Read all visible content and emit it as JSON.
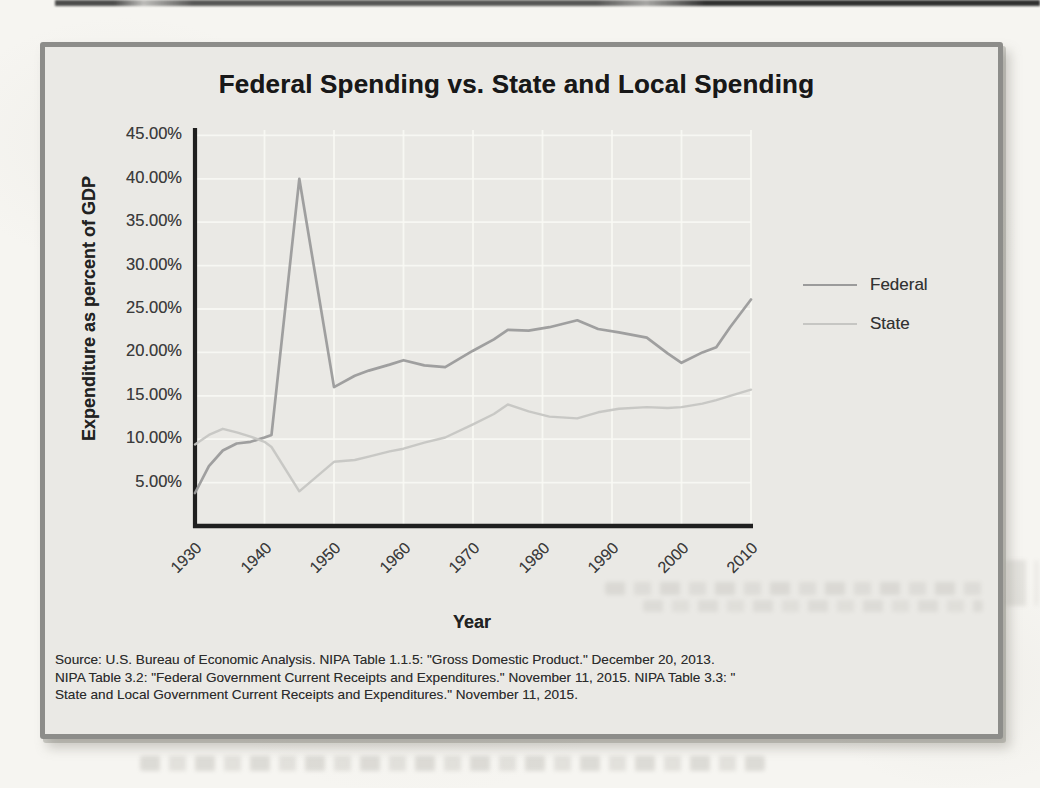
{
  "colors": {
    "page_bg": "#f6f5f1",
    "frame_bg": "#eae9e5",
    "frame_border": "#8d8d8a",
    "grid": "#f8f8f4",
    "axis": "#1f1f1f",
    "federal_line": "#9b9b9b",
    "state_line": "#c6c6c3",
    "text": "#2c2c2c"
  },
  "chart_data": {
    "type": "line",
    "title": "Federal Spending vs. State and Local Spending",
    "xlabel": "Year",
    "ylabel": "Expenditure as percent of GDP",
    "xlim": [
      1930,
      2010
    ],
    "ylim": [
      0,
      45.8
    ],
    "grid": true,
    "legend_position": "right-outside",
    "x_ticks": [
      1930,
      1940,
      1950,
      1960,
      1970,
      1980,
      1990,
      2000,
      2010
    ],
    "y_tick_values": [
      5,
      10,
      15,
      20,
      25,
      30,
      35,
      40,
      45
    ],
    "y_tick_labels": [
      "5.00%",
      "10.00%",
      "15.00%",
      "20.00%",
      "25.00%",
      "30.00%",
      "35.00%",
      "40.00%",
      "45.00%"
    ],
    "x": [
      1930,
      1932,
      1934,
      1936,
      1938,
      1940,
      1941,
      1945,
      1950,
      1953,
      1955,
      1958,
      1960,
      1963,
      1966,
      1970,
      1973,
      1975,
      1978,
      1981,
      1985,
      1988,
      1991,
      1995,
      1998,
      2000,
      2003,
      2005,
      2007,
      2010
    ],
    "series": [
      {
        "name": "Federal",
        "color": "#9b9b9b",
        "values": [
          3.8,
          6.9,
          8.7,
          9.5,
          9.7,
          10.2,
          10.5,
          40.0,
          16.0,
          17.3,
          17.9,
          18.6,
          19.1,
          18.5,
          18.3,
          20.2,
          21.5,
          22.6,
          22.5,
          22.9,
          23.7,
          22.7,
          22.3,
          21.7,
          19.9,
          18.8,
          20.0,
          20.6,
          22.9,
          26.1
        ]
      },
      {
        "name": "State",
        "color": "#c6c6c3",
        "values": [
          9.4,
          10.5,
          11.2,
          10.8,
          10.3,
          9.7,
          9.1,
          4.0,
          7.4,
          7.6,
          8.0,
          8.6,
          8.9,
          9.6,
          10.2,
          11.7,
          12.9,
          14.0,
          13.2,
          12.6,
          12.4,
          13.1,
          13.5,
          13.7,
          13.6,
          13.7,
          14.1,
          14.5,
          15.0,
          15.7
        ]
      }
    ]
  },
  "source": {
    "lines": [
      "Source: U.S. Bureau of Economic Analysis. NIPA Table 1.1.5: \"Gross Domestic Product.\" December 20, 2013.",
      "NIPA Table 3.2: \"Federal Government Current Receipts and Expenditures.\" November 11, 2015. NIPA Table 3.3: \"",
      "State and Local Government Current Receipts and Expenditures.\" November 11, 2015."
    ]
  }
}
